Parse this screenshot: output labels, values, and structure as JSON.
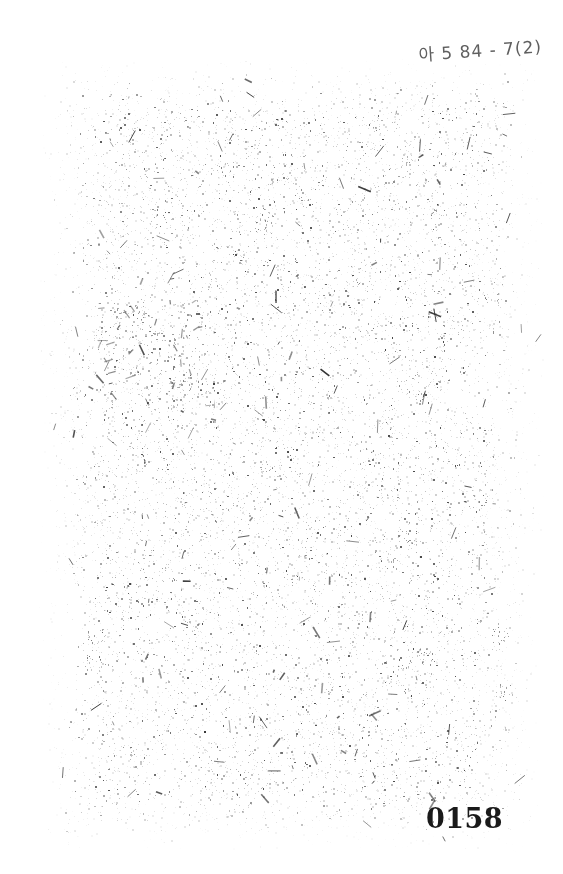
{
  "document": {
    "kind": "scanned-archival-page",
    "page_state": "blank",
    "background_color": "#ffffff",
    "width": 563,
    "height": 874
  },
  "reference_mark": {
    "text": "아 5 84 - 7(2)",
    "ink_color": "#3c3c3c",
    "style": "handwritten",
    "position": "top-right"
  },
  "page_number": {
    "value": "0158",
    "ink_color": "#1a1a1a",
    "style": "printed",
    "position": "bottom-right"
  },
  "scan_noise": {
    "label": "scan-speckle",
    "speck_color": "#4a4a4a",
    "field": {
      "left": 36,
      "top": 55,
      "right": 545,
      "bottom": 852
    },
    "density": "sparse",
    "seed": 20158
  },
  "ghost_marks": {
    "label": "bleed-through-smudge",
    "ink_color": "#2e2e2e",
    "position": "upper-left-body"
  }
}
